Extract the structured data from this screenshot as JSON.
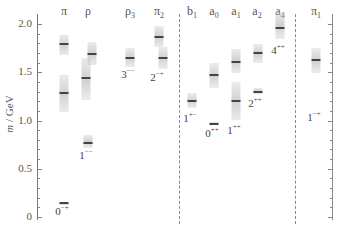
{
  "chart_data": {
    "type": "bar",
    "title": "",
    "xlabel": "",
    "ylabel": "m / GeV",
    "ylim": [
      0,
      2.1
    ],
    "yticks": [
      "0",
      "0.5",
      "1.0",
      "1.5",
      "2.0"
    ],
    "grid": false,
    "legend": null,
    "separators_after": [
      "π2",
      "a4"
    ],
    "categories": [
      "π",
      "ρ",
      "ρ3",
      "π2",
      "b1",
      "a0",
      "a1",
      "a2",
      "a4",
      "π1"
    ],
    "jpc_labels": [
      "0−+",
      "1−−",
      "3−−",
      "2−+",
      "1+−",
      "0++",
      "1++",
      "2++",
      "4++",
      "1−+"
    ],
    "states": [
      {
        "channel": "π",
        "mass": 0.14,
        "low": 0.13,
        "high": 0.15
      },
      {
        "channel": "π",
        "mass": 1.29,
        "low": 1.09,
        "high": 1.47
      },
      {
        "channel": "π",
        "mass": 1.79,
        "low": 1.68,
        "high": 1.89
      },
      {
        "channel": "ρ",
        "mass": 0.77,
        "low": 0.72,
        "high": 0.85
      },
      {
        "channel": "ρ",
        "mass": 1.44,
        "low": 1.21,
        "high": 1.65
      },
      {
        "channel": "ρ",
        "mass": 1.69,
        "low": 1.57,
        "high": 1.81
      },
      {
        "channel": "ρ3",
        "mass": 1.65,
        "low": 1.55,
        "high": 1.75
      },
      {
        "channel": "π2",
        "mass": 1.65,
        "low": 1.53,
        "high": 1.76
      },
      {
        "channel": "π2",
        "mass": 1.87,
        "low": 1.76,
        "high": 1.98
      },
      {
        "channel": "b1",
        "mass": 1.2,
        "low": 1.13,
        "high": 1.28
      },
      {
        "channel": "a0",
        "mass": 0.96,
        "low": 0.95,
        "high": 0.98
      },
      {
        "channel": "a0",
        "mass": 1.47,
        "low": 1.34,
        "high": 1.6
      },
      {
        "channel": "a1",
        "mass": 1.2,
        "low": 1.0,
        "high": 1.4
      },
      {
        "channel": "a1",
        "mass": 1.61,
        "low": 1.49,
        "high": 1.74
      },
      {
        "channel": "a2",
        "mass": 1.3,
        "low": 1.27,
        "high": 1.34
      },
      {
        "channel": "a2",
        "mass": 1.7,
        "low": 1.6,
        "high": 1.79
      },
      {
        "channel": "a4",
        "mass": 1.96,
        "low": 1.84,
        "high": 2.12
      },
      {
        "channel": "π1",
        "mass": 1.63,
        "low": 1.49,
        "high": 1.75
      }
    ]
  },
  "axis": {
    "title_italic": "m",
    "title_rest": " / GeV",
    "ticks": [
      {
        "label": "0",
        "value": 0
      },
      {
        "label": "0.5",
        "value": 0.5
      },
      {
        "label": "1.0",
        "value": 1.0
      },
      {
        "label": "1.5",
        "value": 1.5
      },
      {
        "label": "2.0",
        "value": 2.0
      }
    ]
  },
  "columns": [
    {
      "base": "π",
      "sub": "",
      "x": 64,
      "jpc_base": "0",
      "jpc_sup": "−+",
      "jpc_y": 204
    },
    {
      "base": "ρ",
      "sub": "",
      "x": 88,
      "jpc_base": "1",
      "jpc_sup": "−−",
      "jpc_y": 148
    },
    {
      "base": "ρ",
      "sub": "3",
      "x": 130,
      "jpc_base": "3",
      "jpc_sup": "−−",
      "jpc_y": 67
    },
    {
      "base": "π",
      "sub": "2",
      "x": 159,
      "jpc_base": "2",
      "jpc_sup": "−+",
      "jpc_y": 70
    },
    {
      "base": "b",
      "sub": "1",
      "x": 192,
      "jpc_base": "1",
      "jpc_sup": "+−",
      "jpc_y": 111
    },
    {
      "base": "a",
      "sub": "0",
      "x": 214,
      "jpc_base": "0",
      "jpc_sup": "++",
      "jpc_y": 126
    },
    {
      "base": "a",
      "sub": "1",
      "x": 236,
      "jpc_base": "1",
      "jpc_sup": "++",
      "jpc_y": 123
    },
    {
      "base": "a",
      "sub": "2",
      "x": 257,
      "jpc_base": "2",
      "jpc_sup": "++",
      "jpc_y": 96
    },
    {
      "base": "a",
      "sub": "4",
      "x": 280,
      "jpc_base": "4",
      "jpc_sup": "++",
      "jpc_y": 43
    },
    {
      "base": "π",
      "sub": "1",
      "x": 316,
      "jpc_base": "1",
      "jpc_sup": "−+",
      "jpc_y": 110
    }
  ],
  "bands": [
    {
      "x": 64,
      "mass": 0.14,
      "low": 0.13,
      "high": 0.15
    },
    {
      "x": 64,
      "mass": 1.29,
      "low": 1.09,
      "high": 1.47
    },
    {
      "x": 64,
      "mass": 1.79,
      "low": 1.68,
      "high": 1.89
    },
    {
      "x": 88,
      "mass": 0.77,
      "low": 0.72,
      "high": 0.85
    },
    {
      "x": 86,
      "mass": 1.44,
      "low": 1.21,
      "high": 1.65
    },
    {
      "x": 92,
      "mass": 1.69,
      "low": 1.57,
      "high": 1.81
    },
    {
      "x": 130,
      "mass": 1.65,
      "low": 1.55,
      "high": 1.75
    },
    {
      "x": 163,
      "mass": 1.65,
      "low": 1.53,
      "high": 1.76
    },
    {
      "x": 159,
      "mass": 1.87,
      "low": 1.76,
      "high": 1.98
    },
    {
      "x": 192,
      "mass": 1.2,
      "low": 1.13,
      "high": 1.28
    },
    {
      "x": 214,
      "mass": 0.96,
      "low": 0.95,
      "high": 0.98
    },
    {
      "x": 214,
      "mass": 1.47,
      "low": 1.34,
      "high": 1.6
    },
    {
      "x": 236,
      "mass": 1.2,
      "low": 1.0,
      "high": 1.4
    },
    {
      "x": 236,
      "mass": 1.61,
      "low": 1.49,
      "high": 1.74
    },
    {
      "x": 258,
      "mass": 1.3,
      "low": 1.27,
      "high": 1.34
    },
    {
      "x": 258,
      "mass": 1.7,
      "low": 1.6,
      "high": 1.79
    },
    {
      "x": 280,
      "mass": 1.96,
      "low": 1.84,
      "high": 2.12
    },
    {
      "x": 316,
      "mass": 1.63,
      "low": 1.49,
      "high": 1.75
    }
  ],
  "separators_x": [
    179,
    295
  ]
}
